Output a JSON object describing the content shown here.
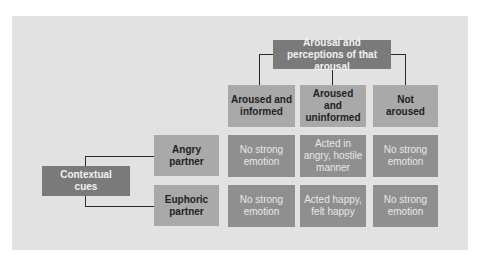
{
  "diagram": {
    "top_header": "Arousal and perceptions of that arousal",
    "left_header": "Contextual cues",
    "columns": [
      "Aroused and informed",
      "Aroused and uninformed",
      "Not aroused"
    ],
    "rows": [
      {
        "label": "Angry partner",
        "cells": [
          "No strong emotion",
          "Acted in angry, hostile manner",
          "No strong emotion"
        ]
      },
      {
        "label": "Euphoric partner",
        "cells": [
          "No strong emotion",
          "Acted happy, felt happy",
          "No strong emotion"
        ]
      }
    ]
  },
  "colors": {
    "panel": "#e2e2e2",
    "header_box": "#7a7a7a",
    "label_box": "#a9a9a9",
    "cell_box": "#8f8f8f",
    "connector": "#2b2b2b"
  }
}
